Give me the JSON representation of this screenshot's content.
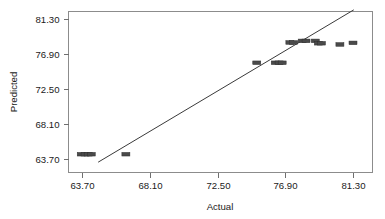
{
  "chart_data": {
    "type": "scatter",
    "title": "",
    "xlabel": "Actual",
    "ylabel": "Predicted",
    "xlim": [
      63.7,
      81.3
    ],
    "ylim": [
      63.7,
      81.3
    ],
    "xticks": [
      "63.70",
      "68.10",
      "72.50",
      "76.90",
      "81.30"
    ],
    "yticks": [
      "63.70",
      "68.10",
      "72.50",
      "76.90",
      "81.30"
    ],
    "xtick_values": [
      63.7,
      68.1,
      72.5,
      76.9,
      81.3
    ],
    "ytick_values": [
      63.7,
      68.1,
      72.5,
      76.9,
      81.3
    ],
    "grid": false,
    "legend": "none",
    "marker": "filled-rectangle",
    "reference_line": {
      "label": "identity-fit-line",
      "x_start": 64.75,
      "y_start": 63.3,
      "x_end": 81.35,
      "y_end": 82.45
    },
    "points": [
      {
        "x": 63.65,
        "y": 64.3
      },
      {
        "x": 63.9,
        "y": 64.3
      },
      {
        "x": 64.1,
        "y": 64.3
      },
      {
        "x": 64.3,
        "y": 64.3
      },
      {
        "x": 66.55,
        "y": 64.3
      },
      {
        "x": 75.05,
        "y": 75.8
      },
      {
        "x": 76.25,
        "y": 75.8
      },
      {
        "x": 76.5,
        "y": 75.8
      },
      {
        "x": 76.7,
        "y": 75.8
      },
      {
        "x": 77.2,
        "y": 78.35
      },
      {
        "x": 77.45,
        "y": 78.35
      },
      {
        "x": 78.0,
        "y": 78.55
      },
      {
        "x": 78.25,
        "y": 78.55
      },
      {
        "x": 78.85,
        "y": 78.55
      },
      {
        "x": 79.05,
        "y": 78.25
      },
      {
        "x": 79.25,
        "y": 78.25
      },
      {
        "x": 80.45,
        "y": 78.1
      },
      {
        "x": 81.3,
        "y": 78.3
      }
    ]
  },
  "axis": {
    "x_title": "Actual",
    "y_title": "Predicted"
  },
  "colors": {
    "marker_fill": "#4a4a4a",
    "marker_stroke": "#2e2e2e",
    "line": "#3a3a3a",
    "frame": "#8c8c8c",
    "text": "#1a1a1a",
    "background": "#ffffff"
  }
}
